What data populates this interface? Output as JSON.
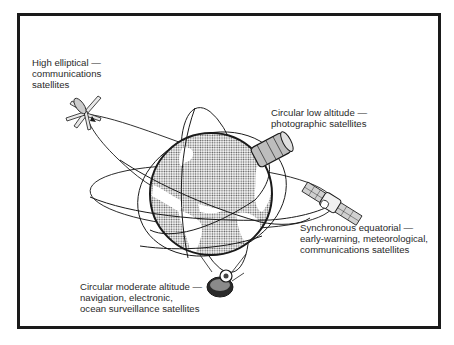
{
  "diagram": {
    "type": "satellite-orbits-illustration",
    "center_object": "earth-globe",
    "labels": {
      "high_elliptical": {
        "lines": [
          "High elliptical —",
          "communications",
          "satellites"
        ]
      },
      "circular_low": {
        "lines": [
          "Circular low altitude —",
          "photographic satellites"
        ]
      },
      "synchronous_equatorial": {
        "lines": [
          "Synchronous equatorial —",
          "early-warning, meteorological,",
          "communications satellites"
        ]
      },
      "circular_moderate": {
        "lines": [
          "Circular moderate altitude —",
          "navigation, electronic,",
          "ocean surveillance satellites"
        ]
      }
    },
    "satellites": [
      {
        "name": "high-elliptical-satellite",
        "orbit": "high elliptical"
      },
      {
        "name": "low-altitude-satellite",
        "orbit": "circular low altitude"
      },
      {
        "name": "synchronous-satellite",
        "orbit": "synchronous equatorial"
      },
      {
        "name": "moderate-altitude-satellite",
        "orbit": "circular moderate altitude"
      }
    ],
    "colors": {
      "ink": "#1a1a1a",
      "paper": "#ffffff",
      "ocean_halftone": "#555555"
    }
  }
}
